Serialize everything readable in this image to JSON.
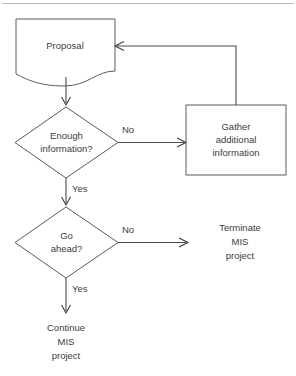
{
  "diagram": {
    "colors": {
      "stroke": "#5a5a5a",
      "edge": "#4a4a4a",
      "text": "#3c3c3c",
      "rule": "#b9b9b9",
      "background": "#ffffff"
    },
    "nodes": {
      "proposal": {
        "shape": "document",
        "label": "Proposal"
      },
      "enough_information": {
        "shape": "diamond",
        "label_line1": "Enough",
        "label_line2": "information?"
      },
      "gather": {
        "shape": "rectangle",
        "label_line1": "Gather",
        "label_line2": "additional",
        "label_line3": "information"
      },
      "go_ahead": {
        "shape": "diamond",
        "label_line1": "Go",
        "label_line2": "ahead?"
      },
      "terminate": {
        "shape": "text",
        "label_line1": "Terminate",
        "label_line2": "MIS",
        "label_line3": "project"
      },
      "continue": {
        "shape": "text",
        "label_line1": "Continue",
        "label_line2": "MIS",
        "label_line3": "project"
      }
    },
    "edges": {
      "proposal_to_enough": {
        "label": ""
      },
      "enough_no_to_gather": {
        "label": "No"
      },
      "gather_back_to_proposal": {
        "label": ""
      },
      "enough_yes_to_goahead": {
        "label": "Yes"
      },
      "goahead_no_to_terminate": {
        "label": "No"
      },
      "goahead_yes_to_continue": {
        "label": "Yes"
      }
    }
  }
}
